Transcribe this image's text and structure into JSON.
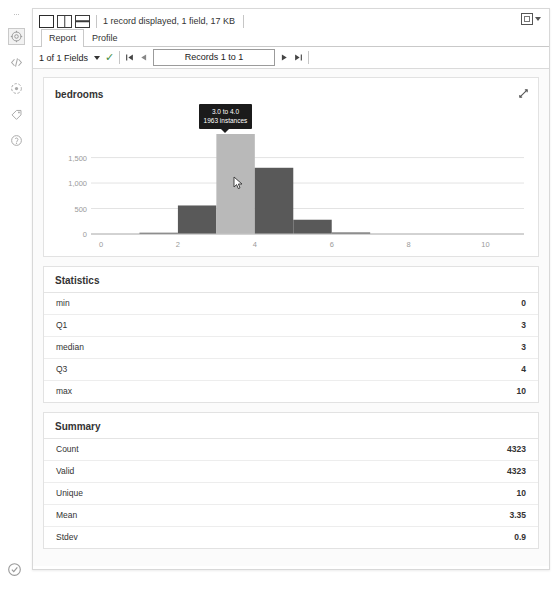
{
  "rail": {
    "icons": [
      "settings-gear-icon",
      "code-icon",
      "target-icon",
      "tag-icon",
      "help-icon"
    ],
    "bottom_icon": "status-check-icon"
  },
  "toolbar": {
    "views": [
      "single-pane-view",
      "vertical-split-view",
      "horizontal-split-view"
    ],
    "status": "1 record displayed, 1 field, 17 KB",
    "panel_button": "panel-layout-button"
  },
  "tabs": [
    {
      "label": "Report",
      "active": true
    },
    {
      "label": "Profile",
      "active": false
    }
  ],
  "navbar": {
    "fields_label": "1 of 1 Fields",
    "check_icon": "✓",
    "first_icon": "first-record-icon",
    "prev_icon": "previous-record-icon",
    "records_label": "Records 1 to 1",
    "next_icon": "next-record-icon",
    "last_icon": "last-record-icon"
  },
  "chart_card": {
    "title": "bedrooms",
    "expand_icon": "expand-diagonal-icon",
    "tooltip": {
      "range": "3.0 to 4.0",
      "instances": "1963 instances"
    }
  },
  "chart_data": {
    "type": "bar",
    "title": "bedrooms",
    "xlabel": "",
    "ylabel": "",
    "xlim": [
      0,
      11
    ],
    "ylim": [
      0,
      1963
    ],
    "xticks": [
      "0",
      "2",
      "4",
      "6",
      "8",
      "10"
    ],
    "xtick_values": [
      0,
      2,
      4,
      6,
      8,
      10
    ],
    "yticks": [
      "0",
      "500",
      "1,000",
      "1,500"
    ],
    "ytick_values": [
      0,
      500,
      1000,
      1500
    ],
    "grid": true,
    "legend": null,
    "bin_width": 1,
    "bins": [
      {
        "start": 1,
        "end": 2,
        "value": 25,
        "highlighted": false
      },
      {
        "start": 2,
        "end": 3,
        "value": 560,
        "highlighted": false
      },
      {
        "start": 3,
        "end": 4,
        "value": 1963,
        "highlighted": true
      },
      {
        "start": 4,
        "end": 5,
        "value": 1300,
        "highlighted": false
      },
      {
        "start": 5,
        "end": 6,
        "value": 280,
        "highlighted": false
      },
      {
        "start": 6,
        "end": 7,
        "value": 30,
        "highlighted": false
      }
    ],
    "bar_color": "#595959",
    "highlight_color": "#b9b9b9"
  },
  "statistics": {
    "title": "Statistics",
    "rows": [
      {
        "key": "min",
        "value": "0"
      },
      {
        "key": "Q1",
        "value": "3"
      },
      {
        "key": "median",
        "value": "3"
      },
      {
        "key": "Q3",
        "value": "4"
      },
      {
        "key": "max",
        "value": "10"
      }
    ]
  },
  "summary": {
    "title": "Summary",
    "rows": [
      {
        "key": "Count",
        "value": "4323"
      },
      {
        "key": "Valid",
        "value": "4323"
      },
      {
        "key": "Unique",
        "value": "10"
      },
      {
        "key": "Mean",
        "value": "3.35"
      },
      {
        "key": "Stdev",
        "value": "0.9"
      }
    ]
  },
  "colors": {
    "bar": "#595959",
    "highlight": "#b9b9b9",
    "tooltip_bg": "#1b1b1b",
    "check": "#3f8c3f"
  }
}
